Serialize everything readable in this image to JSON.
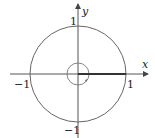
{
  "diagram": {
    "axes": {
      "x_label": "x",
      "y_label": "y"
    },
    "ticks": {
      "x_pos": "1",
      "x_neg": "−1",
      "y_pos": "1",
      "y_neg": "−1"
    },
    "shapes": [
      {
        "type": "circle",
        "name": "unit-circle",
        "radius": 1
      },
      {
        "type": "circle",
        "name": "small-circle",
        "radius": 0.23,
        "arrow": "counterclockwise"
      },
      {
        "type": "segment",
        "name": "branch-cut",
        "from": [
          0,
          0
        ],
        "to": [
          1,
          0
        ]
      }
    ],
    "colors": {
      "stroke": "#555555",
      "text": "#222222"
    }
  }
}
